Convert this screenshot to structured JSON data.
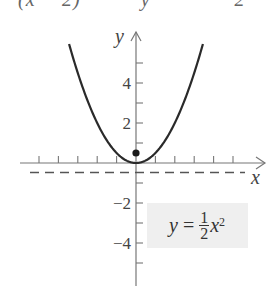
{
  "cropped_top_text": "(x − 2)          y              2",
  "chart_data": {
    "type": "line",
    "title": "",
    "function": "y = (1/2)x^2",
    "equation_label": {
      "lhs": "y",
      "eq": "=",
      "num": "1",
      "den": "2",
      "var": "x",
      "exp": "2"
    },
    "xlabel": "x",
    "ylabel": "y",
    "x_range": [
      -5,
      6
    ],
    "y_range": [
      -6,
      6.5
    ],
    "x_ticks": [
      -5,
      -4,
      -3,
      -2,
      -1,
      1,
      2,
      3,
      4,
      5
    ],
    "y_ticks": [
      -5,
      -4,
      -3,
      -2,
      -1,
      1,
      2,
      3,
      4,
      5
    ],
    "y_tick_labels": [
      {
        "value": 4,
        "text": "4"
      },
      {
        "value": 2,
        "text": "2"
      },
      {
        "value": -2,
        "text": "−2"
      },
      {
        "value": -4,
        "text": "−4"
      }
    ],
    "curve_x_extent": [
      -3.45,
      3.45
    ],
    "focus": {
      "x": 0,
      "y": 0.5
    },
    "directrix": {
      "y": -0.5,
      "style": "dashed"
    },
    "grid": false,
    "colors": {
      "curve": "#2a2a2a",
      "axes": "#777777",
      "directrix": "#555555",
      "focus": "#1a1a1a",
      "label_box": "#efefef"
    }
  }
}
